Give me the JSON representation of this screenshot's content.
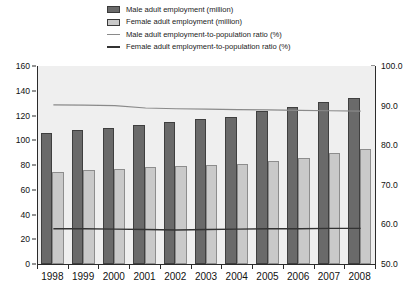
{
  "legend": {
    "items": [
      {
        "key": "male-bar",
        "label": "Male adult employment (million)"
      },
      {
        "key": "female-bar",
        "label": "Female adult employment (million)"
      },
      {
        "key": "male-line",
        "label": "Male adult employment-to-population ratio (%)"
      },
      {
        "key": "female-line",
        "label": "Female adult employment-to-population ratio (%)"
      }
    ]
  },
  "colors": {
    "male_bar": "#6a6a6a",
    "female_bar": "#c9c9c9",
    "male_line": "#8a8a8a",
    "female_line": "#333333",
    "plot_background": "#efefef",
    "axis": "#2b2b2b"
  },
  "axes": {
    "left_ticks": [
      "0",
      "20",
      "40",
      "60",
      "80",
      "100",
      "120",
      "140",
      "160"
    ],
    "right_ticks": [
      "50.0",
      "60.0",
      "70.0",
      "80.0",
      "90.0",
      "100.0"
    ]
  },
  "chart_data": {
    "type": "bar",
    "title": "",
    "subtitle": "",
    "xlabel": "",
    "ylabel": "",
    "y2label": "",
    "grid": false,
    "legend_position": "top",
    "categories": [
      "1998",
      "1999",
      "2000",
      "2001",
      "2002",
      "2003",
      "2004",
      "2005",
      "2006",
      "2007",
      "2008"
    ],
    "ylim": [
      0,
      160
    ],
    "ytick_step": 20,
    "y2lim": [
      50.0,
      100.0
    ],
    "y2tick_step": 10,
    "series": [
      {
        "name": "Male adult employment (million)",
        "type": "bar",
        "axis": "left",
        "color": "#6a6a6a",
        "values": [
          106,
          108,
          110,
          112,
          115,
          117,
          119,
          124,
          127,
          131,
          134
        ]
      },
      {
        "name": "Female adult employment (million)",
        "type": "bar",
        "axis": "left",
        "color": "#c9c9c9",
        "values": [
          74,
          76,
          77,
          78,
          79,
          80,
          81,
          83,
          86,
          90,
          93
        ]
      },
      {
        "name": "Male adult employment-to-population ratio (%)",
        "type": "line",
        "axis": "right",
        "color": "#8a8a8a",
        "values": [
          90.2,
          90.1,
          90.0,
          89.4,
          89.2,
          89.1,
          89.0,
          88.9,
          88.8,
          88.7,
          88.6
        ]
      },
      {
        "name": "Female adult employment-to-population ratio (%)",
        "type": "line",
        "axis": "right",
        "color": "#333333",
        "values": [
          58.9,
          58.9,
          58.8,
          58.7,
          58.6,
          58.7,
          58.8,
          58.9,
          58.9,
          59.0,
          59.0
        ]
      }
    ]
  }
}
